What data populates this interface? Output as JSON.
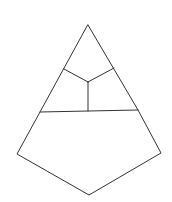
{
  "diagram": {
    "type": "line-drawing",
    "stroke_color": "#333333",
    "background": "#ffffff",
    "vertices": {
      "apex": [
        88,
        25
      ],
      "upper_left": [
        64,
        69
      ],
      "upper_right": [
        114,
        68
      ],
      "center": [
        88,
        82
      ],
      "mid_left": [
        40,
        112
      ],
      "mid_center": [
        88,
        111
      ],
      "mid_right": [
        138,
        110
      ],
      "lower_left": [
        17,
        154
      ],
      "lower_right": [
        161,
        153
      ],
      "bottom": [
        89,
        195
      ]
    },
    "outline": [
      "apex",
      "mid_right",
      "lower_right",
      "bottom",
      "lower_left",
      "mid_left",
      "apex"
    ],
    "inner_edges": [
      [
        "upper_left",
        "center"
      ],
      [
        "upper_right",
        "center"
      ],
      [
        "center",
        "mid_center"
      ],
      [
        "mid_left",
        "mid_right"
      ]
    ]
  }
}
